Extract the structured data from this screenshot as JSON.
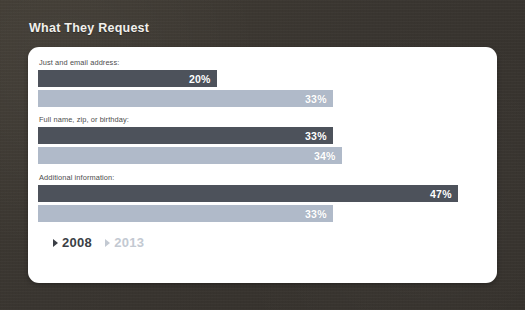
{
  "theme": {
    "background": "#3b372f",
    "card_background": "#ffffff",
    "title_color": "#f2f0ec",
    "series_2008_color": "#4d525b",
    "series_2013_color": "#b0bac9"
  },
  "header": {
    "title": "What They Request"
  },
  "legend": {
    "items": [
      {
        "label": "2008",
        "marker": "triangle-right-marker",
        "color": "#3b3f46"
      },
      {
        "label": "2013",
        "marker": "triangle-right-marker",
        "color": "#c3c9d2"
      }
    ]
  },
  "chart_data": {
    "type": "bar",
    "orientation": "horizontal",
    "title": "What They Request",
    "xlabel": "",
    "ylabel": "",
    "xlim": [
      0,
      50
    ],
    "grid": false,
    "legend_position": "bottom-left",
    "value_format": "percent",
    "categories": [
      "Just and email address:",
      "Full name, zip, or birthday:",
      "Additional information:"
    ],
    "series": [
      {
        "name": "2008",
        "color": "#4d525b",
        "values": [
          20,
          33,
          47
        ],
        "labels": [
          "20%",
          "33%",
          "47%"
        ]
      },
      {
        "name": "2013",
        "color": "#b0bac9",
        "values": [
          33,
          34,
          33
        ],
        "labels": [
          "33%",
          "34%",
          "33%"
        ]
      }
    ]
  },
  "groups": [
    {
      "label": "Just and email address:",
      "bars": [
        {
          "series": "2008",
          "value": 20,
          "label": "20%"
        },
        {
          "series": "2013",
          "value": 33,
          "label": "33%"
        }
      ]
    },
    {
      "label": "Full name, zip, or birthday:",
      "bars": [
        {
          "series": "2008",
          "value": 33,
          "label": "33%"
        },
        {
          "series": "2013",
          "value": 34,
          "label": "34%"
        }
      ]
    },
    {
      "label": "Additional information:",
      "bars": [
        {
          "series": "2008",
          "value": 47,
          "label": "47%"
        },
        {
          "series": "2013",
          "value": 33,
          "label": "33%"
        }
      ]
    }
  ]
}
